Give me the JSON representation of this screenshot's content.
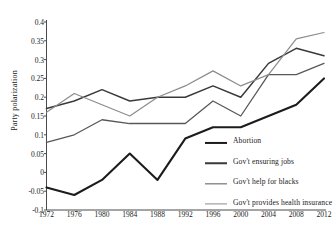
{
  "chart_data": {
    "type": "line",
    "title": "",
    "xlabel": "",
    "ylabel": "Party polarization",
    "x": [
      1972,
      1976,
      1980,
      1984,
      1988,
      1992,
      1996,
      2000,
      2004,
      2008,
      2012
    ],
    "xticklabels": [
      "1972",
      "1976",
      "1980",
      "1984",
      "1988",
      "1992",
      "1996",
      "2000",
      "2004",
      "2008",
      "2012"
    ],
    "yticklabels": [
      "0.4",
      "0.35",
      "0.3",
      "0.25",
      "0.2",
      "0.15",
      "0.1",
      "0.05",
      "0",
      "-0.05",
      "-0.1"
    ],
    "ytickvalues": [
      0.4,
      0.35,
      0.3,
      0.25,
      0.2,
      0.15,
      0.1,
      0.05,
      0,
      -0.05,
      -0.1
    ],
    "ylim": [
      -0.1,
      0.4
    ],
    "xlim": [
      1972,
      2012
    ],
    "grid": false,
    "legend_position": "inside lower right",
    "series": [
      {
        "name": "Abortion",
        "color": "#1c1c1c",
        "width": 2.1,
        "values": [
          -0.04,
          -0.06,
          -0.02,
          0.05,
          -0.02,
          0.09,
          0.12,
          0.12,
          0.15,
          0.18,
          0.25
        ]
      },
      {
        "name": "Gov't ensuring jobs",
        "color": "#3a3a3a",
        "width": 1.5,
        "values": [
          0.17,
          0.19,
          0.22,
          0.19,
          0.2,
          0.2,
          0.23,
          0.2,
          0.29,
          0.33,
          0.31
        ]
      },
      {
        "name": "Gov't help for blacks",
        "color": "#585858",
        "width": 1.3,
        "values": [
          0.08,
          0.1,
          0.14,
          0.13,
          0.13,
          0.13,
          0.19,
          0.15,
          0.26,
          0.26,
          0.29
        ]
      },
      {
        "name": "Gov't provides health insurance",
        "color": "#8c8c8c",
        "width": 1.2,
        "values": [
          0.16,
          0.21,
          0.18,
          0.15,
          0.2,
          0.23,
          0.27,
          0.23,
          0.26,
          0.355,
          0.372
        ]
      }
    ]
  },
  "legend": {
    "items": [
      {
        "label": "Abortion"
      },
      {
        "label": "Gov't ensuring jobs"
      },
      {
        "label": "Gov't help for blacks"
      },
      {
        "label": "Gov't provides health insurance"
      }
    ]
  },
  "axes": {
    "axis_color": "#4a4a4a",
    "text_color": "#1a1a1a"
  }
}
